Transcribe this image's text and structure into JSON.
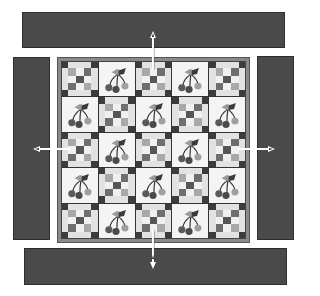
{
  "diagram": {
    "type": "quilt-assembly",
    "colors": {
      "border_strip": "#4a4a4a",
      "background": "#ffffff",
      "arrow": "#ffffff",
      "block_background": "#f4f4f4"
    },
    "center": {
      "rows": 5,
      "columns": 5,
      "layout": [
        [
          "ninepatch",
          "cherry",
          "ninepatch",
          "cherry",
          "ninepatch"
        ],
        [
          "cherry",
          "ninepatch",
          "cherry",
          "ninepatch",
          "cherry"
        ],
        [
          "ninepatch",
          "cherry",
          "ninepatch",
          "cherry",
          "ninepatch"
        ],
        [
          "cherry",
          "ninepatch",
          "cherry",
          "ninepatch",
          "cherry"
        ],
        [
          "ninepatch",
          "cherry",
          "ninepatch",
          "cherry",
          "ninepatch"
        ]
      ]
    },
    "borders": [
      {
        "side": "top",
        "arrow_direction": "down"
      },
      {
        "side": "bottom",
        "arrow_direction": "up"
      },
      {
        "side": "left",
        "arrow_direction": "right"
      },
      {
        "side": "right",
        "arrow_direction": "left"
      }
    ],
    "icons": {
      "block_a": "nine-patch-block-icon",
      "block_b": "cherry-applique-icon",
      "connector": "arrow-icon"
    }
  }
}
